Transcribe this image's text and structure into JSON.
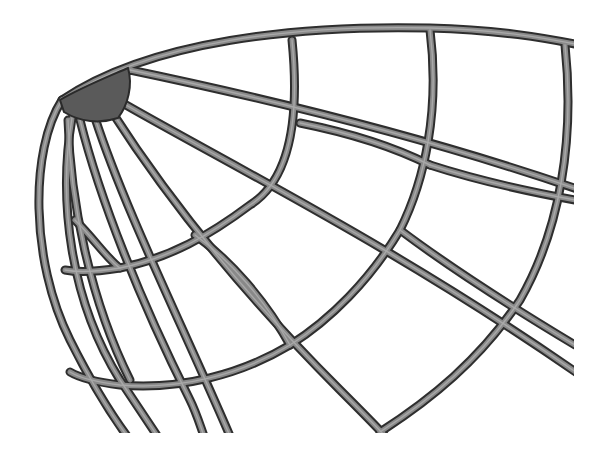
{
  "image": {
    "subject": "3D wireframe dome / bowl lattice render",
    "background": "#ffffff",
    "colors": {
      "rib_outline": "#2e2e2e",
      "rib_fill": "#8a8a8a",
      "rib_highlight": "#a9a9a9",
      "hub_cap": "#5a5a5a"
    },
    "clip": {
      "right_x": 574,
      "bottom_y": 433
    }
  }
}
